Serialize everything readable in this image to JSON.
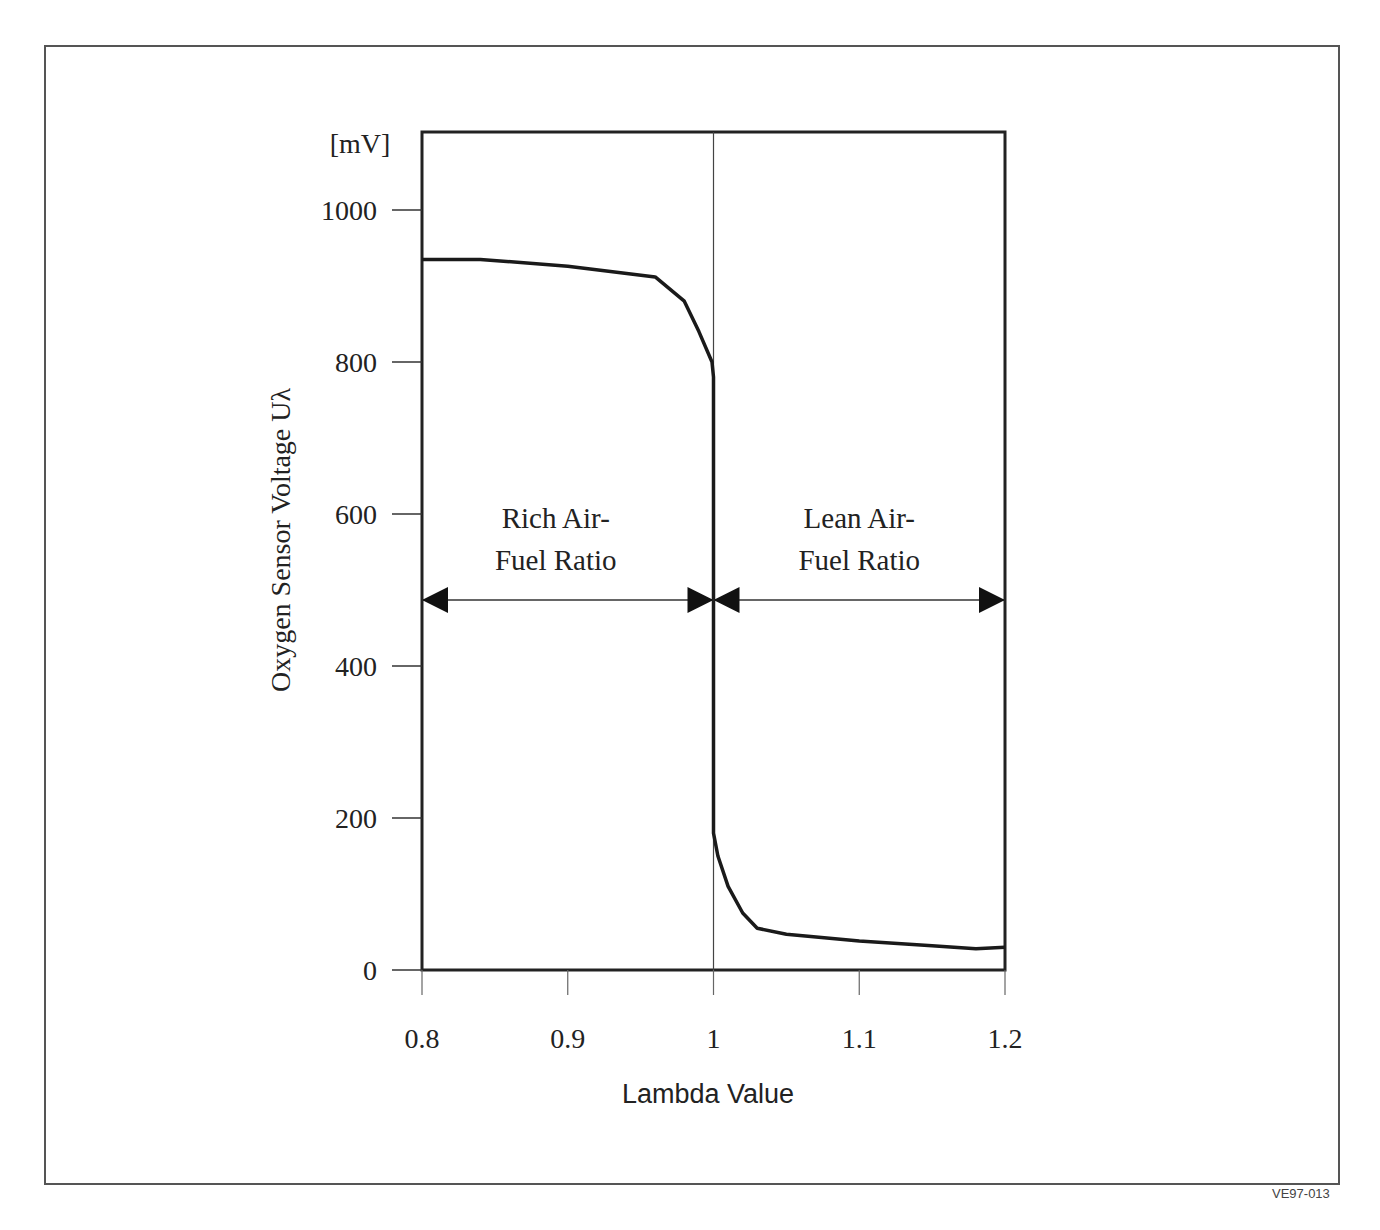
{
  "figure_code": "VE97-013",
  "chart_data": {
    "type": "line",
    "title": "",
    "xlabel": "Lambda Value",
    "ylabel": "Oxygen Sensor Voltage Uλ",
    "yunit": "[mV]",
    "xlim": [
      0.8,
      1.2
    ],
    "ylim": [
      0,
      1100
    ],
    "xticks": [
      "0.8",
      "0.9",
      "1",
      "1.1",
      "1.2"
    ],
    "yticks": [
      "0",
      "200",
      "400",
      "600",
      "800",
      "1000"
    ],
    "grid": false,
    "legend": null,
    "series": [
      {
        "name": "Oxygen sensor voltage",
        "x": [
          0.8,
          0.84,
          0.9,
          0.96,
          0.98,
          0.99,
          0.999,
          1.0,
          1.0,
          1.003,
          1.01,
          1.02,
          1.03,
          1.05,
          1.1,
          1.15,
          1.18,
          1.2
        ],
        "y": [
          935,
          935,
          926,
          912,
          880,
          840,
          800,
          780,
          180,
          150,
          110,
          75,
          55,
          47,
          38,
          32,
          28,
          30
        ]
      }
    ],
    "annotations": [
      {
        "text_line1": "Rich Air-",
        "text_line2": "Fuel Ratio",
        "span": [
          0.8,
          1.0
        ],
        "y": 485
      },
      {
        "text_line1": "Lean Air-",
        "text_line2": "Fuel Ratio",
        "span": [
          1.0,
          1.2
        ],
        "y": 485
      }
    ],
    "vertical_line": 1.0
  }
}
